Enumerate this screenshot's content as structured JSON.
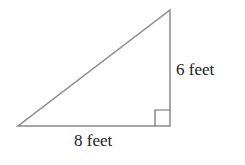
{
  "diagram": {
    "type": "right-triangle",
    "labels": {
      "vertical_side": "6 feet",
      "horizontal_side": "8 feet"
    },
    "stroke_color": "#8a8a8a",
    "text_color": "#222222"
  }
}
